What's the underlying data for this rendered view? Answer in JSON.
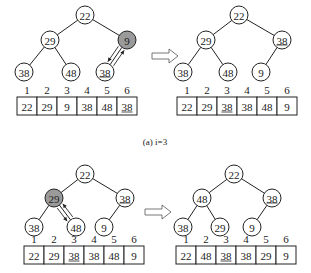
{
  "figure": {
    "caption_a": "(a) i=3",
    "highlight_color": "#9a9a9a",
    "panels": [
      {
        "id": "a-before",
        "nodes": [
          {
            "label": "22",
            "x": 85,
            "y": 15,
            "highlight": false,
            "underline": false
          },
          {
            "label": "29",
            "x": 50,
            "y": 40,
            "highlight": false,
            "underline": false
          },
          {
            "label": "9",
            "x": 127,
            "y": 40,
            "highlight": true,
            "underline": false
          },
          {
            "label": "38",
            "x": 24,
            "y": 72,
            "highlight": false,
            "underline": false
          },
          {
            "label": "48",
            "x": 71,
            "y": 72,
            "highlight": false,
            "underline": false
          },
          {
            "label": "38",
            "x": 105,
            "y": 72,
            "highlight": false,
            "underline": true
          }
        ],
        "edges": [
          [
            0,
            1
          ],
          [
            0,
            2
          ],
          [
            1,
            3
          ],
          [
            1,
            4
          ],
          [
            2,
            5
          ]
        ],
        "swap": {
          "from": 2,
          "to": 5
        },
        "array": {
          "x": 17,
          "y": 97,
          "indices": [
            "1",
            "2",
            "3",
            "4",
            "5",
            "6"
          ],
          "values": [
            "22",
            "29",
            "9",
            "38",
            "48",
            "38"
          ],
          "underlined": [
            5
          ]
        }
      },
      {
        "id": "a-after",
        "nodes": [
          {
            "label": "22",
            "x": 239,
            "y": 15,
            "highlight": false,
            "underline": false
          },
          {
            "label": "29",
            "x": 206,
            "y": 40,
            "highlight": false,
            "underline": false
          },
          {
            "label": "38",
            "x": 282,
            "y": 40,
            "highlight": false,
            "underline": true
          },
          {
            "label": "38",
            "x": 183,
            "y": 72,
            "highlight": false,
            "underline": false
          },
          {
            "label": "48",
            "x": 228,
            "y": 72,
            "highlight": false,
            "underline": false
          },
          {
            "label": "9",
            "x": 261,
            "y": 72,
            "highlight": false,
            "underline": false
          }
        ],
        "edges": [
          [
            0,
            1
          ],
          [
            0,
            2
          ],
          [
            1,
            3
          ],
          [
            1,
            4
          ],
          [
            2,
            5
          ]
        ],
        "swap": null,
        "array": {
          "x": 177,
          "y": 97,
          "indices": [
            "1",
            "2",
            "3",
            "4",
            "5",
            "6"
          ],
          "values": [
            "22",
            "29",
            "38",
            "38",
            "48",
            "9"
          ],
          "underlined": [
            2
          ]
        }
      },
      {
        "id": "b-before",
        "nodes": [
          {
            "label": "22",
            "x": 85,
            "y": 174,
            "highlight": false,
            "underline": false
          },
          {
            "label": "29",
            "x": 54,
            "y": 198,
            "highlight": true,
            "underline": false
          },
          {
            "label": "38",
            "x": 125,
            "y": 198,
            "highlight": false,
            "underline": true
          },
          {
            "label": "38",
            "x": 34,
            "y": 227,
            "highlight": false,
            "underline": false
          },
          {
            "label": "48",
            "x": 76,
            "y": 227,
            "highlight": false,
            "underline": false
          },
          {
            "label": "9",
            "x": 104,
            "y": 227,
            "highlight": false,
            "underline": false
          }
        ],
        "edges": [
          [
            0,
            1
          ],
          [
            0,
            2
          ],
          [
            1,
            3
          ],
          [
            1,
            4
          ],
          [
            2,
            5
          ]
        ],
        "swap": {
          "from": 1,
          "to": 4
        },
        "array": {
          "x": 24,
          "y": 246,
          "indices": [
            "1",
            "2",
            "3",
            "4",
            "5",
            "6"
          ],
          "values": [
            "22",
            "29",
            "38",
            "38",
            "48",
            "9"
          ],
          "underlined": [
            2
          ]
        }
      },
      {
        "id": "b-after",
        "nodes": [
          {
            "label": "22",
            "x": 234,
            "y": 174,
            "highlight": false,
            "underline": false
          },
          {
            "label": "48",
            "x": 202,
            "y": 198,
            "highlight": false,
            "underline": false
          },
          {
            "label": "38",
            "x": 272,
            "y": 198,
            "highlight": false,
            "underline": true
          },
          {
            "label": "38",
            "x": 183,
            "y": 227,
            "highlight": false,
            "underline": false
          },
          {
            "label": "29",
            "x": 220,
            "y": 227,
            "highlight": false,
            "underline": false
          },
          {
            "label": "9",
            "x": 252,
            "y": 227,
            "highlight": false,
            "underline": false
          }
        ],
        "edges": [
          [
            0,
            1
          ],
          [
            0,
            2
          ],
          [
            1,
            3
          ],
          [
            1,
            4
          ],
          [
            2,
            5
          ]
        ],
        "swap": null,
        "array": {
          "x": 176,
          "y": 246,
          "indices": [
            "1",
            "2",
            "3",
            "4",
            "5",
            "6"
          ],
          "values": [
            "22",
            "48",
            "38",
            "38",
            "29",
            "9"
          ],
          "underlined": [
            2
          ]
        }
      }
    ],
    "transition_arrows": [
      {
        "x": 152,
        "y": 56
      },
      {
        "x": 145,
        "y": 212
      }
    ]
  }
}
